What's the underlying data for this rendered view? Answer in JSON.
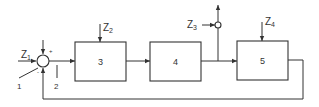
{
  "diagram": {
    "type": "control-loop block diagram",
    "blocks": [
      {
        "id": "3",
        "label": "3"
      },
      {
        "id": "4",
        "label": "4"
      },
      {
        "id": "5",
        "label": "5"
      }
    ],
    "summing_junction": {
      "plus_sign": "+",
      "minus_sign": "-"
    },
    "disturbances": {
      "z1": {
        "main": "Z",
        "sub": "1"
      },
      "z2": {
        "main": "Z",
        "sub": "2"
      },
      "z3": {
        "main": "Z",
        "sub": "3"
      },
      "z4": {
        "main": "Z",
        "sub": "4"
      }
    },
    "callouts": {
      "one": "1",
      "two": "2"
    },
    "colors": {
      "line": "#333333",
      "background": "#ffffff"
    }
  }
}
